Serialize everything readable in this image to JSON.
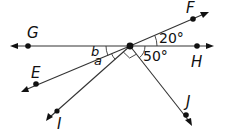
{
  "diagram": {
    "title": "",
    "vertex": {
      "x": 130,
      "y": 46
    },
    "points": {
      "G": {
        "label": "G",
        "x": 28,
        "y": 46,
        "label_x": 27,
        "label_y": 38
      },
      "H": {
        "label": "H",
        "x": 197,
        "y": 46,
        "label_x": 192,
        "label_y": 66
      },
      "F": {
        "label": "F",
        "x": 193,
        "y": 19,
        "label_x": 186,
        "label_y": 13
      },
      "E": {
        "label": "E",
        "x": 36,
        "y": 84,
        "label_x": 31,
        "label_y": 78
      },
      "I": {
        "label": "I",
        "x": 57,
        "y": 111,
        "label_x": 56,
        "label_y": 128
      },
      "J": {
        "label": "J",
        "x": 186,
        "y": 115,
        "label_x": 186,
        "label_y": 107
      }
    },
    "angle_labels": {
      "fh": "20°",
      "hj": "50°",
      "b": "b",
      "a": "a"
    },
    "right_angle_marker": "between rays E-ish and J at vertex",
    "colors": {
      "line": "#333333",
      "point": "#111111",
      "text": "#111111"
    }
  }
}
